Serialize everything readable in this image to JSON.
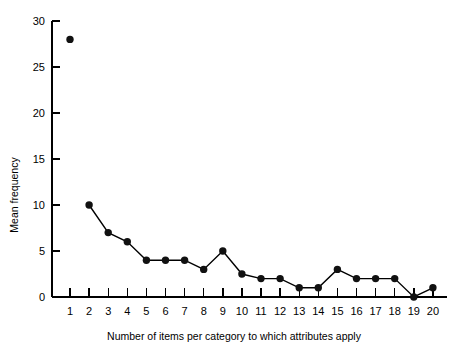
{
  "chart_data": {
    "type": "line",
    "title": "",
    "xlabel": "Number of items per category to which attributes apply",
    "ylabel": "Mean frequency",
    "x": [
      1,
      2,
      3,
      4,
      5,
      6,
      7,
      8,
      9,
      10,
      11,
      12,
      13,
      14,
      15,
      16,
      17,
      18,
      19,
      20
    ],
    "values": [
      28,
      10,
      7,
      6,
      4,
      4,
      4,
      3,
      5,
      2.5,
      2,
      2,
      1,
      1,
      3,
      2,
      2,
      2,
      0,
      1
    ],
    "series": [
      {
        "name": "Mean frequency",
        "values": [
          28,
          10,
          7,
          6,
          4,
          4,
          4,
          3,
          5,
          2.5,
          2,
          2,
          1,
          1,
          3,
          2,
          2,
          2,
          0,
          1
        ]
      }
    ],
    "connected_from_index": 1,
    "xlim": [
      0.4,
      20.6
    ],
    "ylim": [
      0,
      30
    ],
    "xticks": [
      1,
      2,
      3,
      4,
      5,
      6,
      7,
      8,
      9,
      10,
      11,
      12,
      13,
      14,
      15,
      16,
      17,
      18,
      19,
      20
    ],
    "xtick_labels": [
      "1",
      "2",
      "3",
      "4",
      "5",
      "6",
      "7",
      "8",
      "9",
      "10",
      "11",
      "12",
      "13",
      "14",
      "15",
      "16",
      "17",
      "18",
      "19",
      "20"
    ],
    "yticks": [
      0,
      5,
      10,
      15,
      20,
      25,
      30
    ],
    "ytick_labels": [
      "0",
      "5",
      "10",
      "15",
      "20",
      "25",
      "30"
    ],
    "grid": false,
    "legend": null,
    "marker": "filled-circle",
    "marker_color": "#111111",
    "line_color": "#000000"
  },
  "figure": {
    "caption": ""
  }
}
